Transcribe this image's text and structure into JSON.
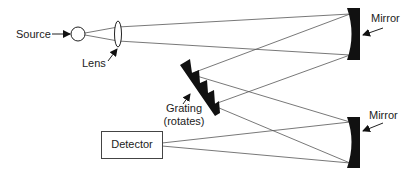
{
  "diagram": {
    "colors": {
      "ink": "#222222",
      "fill": "#111111",
      "background": "#ffffff"
    },
    "labels": {
      "source": "Source",
      "lens": "Lens",
      "mirror_top": "Mirror",
      "mirror_bottom": "Mirror",
      "grating_line1": "Grating",
      "grating_line2": "(rotates)",
      "detector": "Detector"
    },
    "components": [
      {
        "id": "source",
        "shape": "circle"
      },
      {
        "id": "lens",
        "shape": "ellipse"
      },
      {
        "id": "mirror-top",
        "shape": "concave-mirror"
      },
      {
        "id": "grating",
        "shape": "sawtooth-grating"
      },
      {
        "id": "mirror-bottom",
        "shape": "concave-mirror"
      },
      {
        "id": "detector",
        "shape": "rectangle"
      }
    ]
  }
}
